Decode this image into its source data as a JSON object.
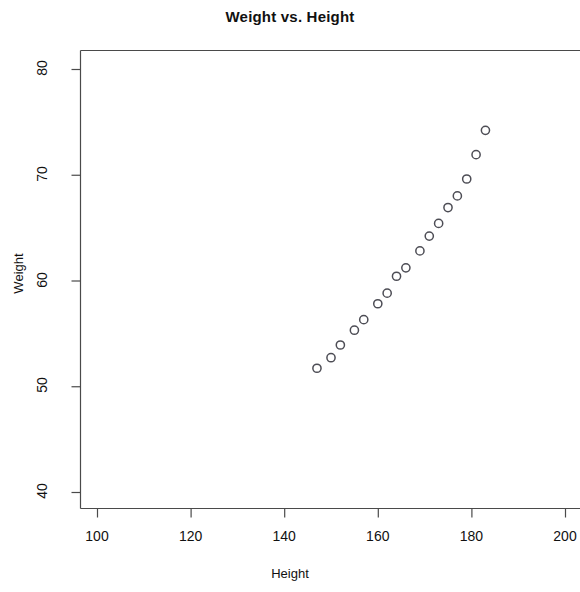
{
  "chart_data": {
    "type": "scatter",
    "title": "Weight vs. Height",
    "xlabel": "Height",
    "ylabel": "Weight",
    "xlim": [
      92,
      203
    ],
    "ylim": [
      38.6,
      81.2
    ],
    "xticks": [
      100,
      120,
      140,
      160,
      180,
      200
    ],
    "yticks": [
      40,
      50,
      60,
      70,
      80
    ],
    "grid": false,
    "legend": null,
    "marker": "open-circle",
    "marker_color": "#4d4d55",
    "x": [
      147,
      150,
      152,
      155,
      157,
      160,
      162,
      164,
      166,
      169,
      171,
      173,
      175,
      177,
      179,
      181,
      183
    ],
    "y": [
      51.7,
      52.7,
      53.9,
      55.3,
      56.3,
      57.8,
      58.8,
      60.4,
      61.2,
      62.8,
      64.2,
      65.4,
      66.9,
      68.0,
      69.6,
      71.9,
      74.2
    ],
    "points": [
      {
        "x": 147,
        "y": 51.7
      },
      {
        "x": 150,
        "y": 52.7
      },
      {
        "x": 152,
        "y": 53.9
      },
      {
        "x": 155,
        "y": 55.3
      },
      {
        "x": 157,
        "y": 56.3
      },
      {
        "x": 160,
        "y": 57.8
      },
      {
        "x": 162,
        "y": 58.8
      },
      {
        "x": 164,
        "y": 60.4
      },
      {
        "x": 166,
        "y": 61.2
      },
      {
        "x": 169,
        "y": 62.8
      },
      {
        "x": 171,
        "y": 64.2
      },
      {
        "x": 173,
        "y": 65.4
      },
      {
        "x": 175,
        "y": 66.9
      },
      {
        "x": 177,
        "y": 68.0
      },
      {
        "x": 179,
        "y": 69.6
      },
      {
        "x": 181,
        "y": 71.9
      },
      {
        "x": 183,
        "y": 74.2
      }
    ]
  }
}
